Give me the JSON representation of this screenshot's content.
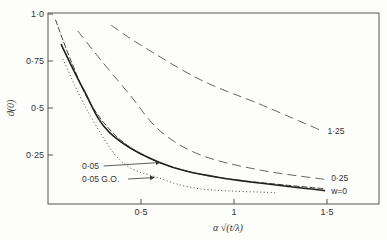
{
  "chart_data": {
    "type": "line",
    "title": "",
    "xlabel": "α √(t/λ)",
    "ylabel": "ϑ(0)",
    "xlim": [
      0,
      1.78
    ],
    "ylim": [
      0,
      1.0
    ],
    "x_ticks": [
      {
        "value": 0.5,
        "label": "0·5"
      },
      {
        "value": 1.0,
        "label": "1"
      },
      {
        "value": 1.5,
        "label": "1·5"
      }
    ],
    "y_ticks": [
      {
        "value": 0.25,
        "label": "0·25"
      },
      {
        "value": 0.5,
        "label": "0·5"
      },
      {
        "value": 0.75,
        "label": "0·75"
      },
      {
        "value": 1.0,
        "label": "1·0"
      }
    ],
    "grid": false,
    "series": [
      {
        "name": "1·25",
        "style": "long-dash",
        "points": [
          [
            0.34,
            0.94
          ],
          [
            0.49,
            0.84
          ],
          [
            0.82,
            0.65
          ],
          [
            1.14,
            0.52
          ],
          [
            1.47,
            0.38
          ]
        ]
      },
      {
        "name": "0·25",
        "style": "long-dash",
        "points": [
          [
            0.16,
            0.91
          ],
          [
            0.28,
            0.76
          ],
          [
            0.44,
            0.57
          ],
          [
            0.6,
            0.38
          ],
          [
            0.82,
            0.25
          ],
          [
            1.14,
            0.17
          ],
          [
            1.49,
            0.12
          ]
        ]
      },
      {
        "name": "0·05",
        "style": "dash",
        "points": [
          [
            0.04,
            0.97
          ],
          [
            0.12,
            0.76
          ],
          [
            0.23,
            0.52
          ],
          [
            0.39,
            0.33
          ],
          [
            0.6,
            0.21
          ],
          [
            0.92,
            0.13
          ],
          [
            1.49,
            0.07
          ]
        ]
      },
      {
        "name": "w=0",
        "style": "solid",
        "points": [
          [
            0.07,
            0.84
          ],
          [
            0.19,
            0.6
          ],
          [
            0.33,
            0.37
          ],
          [
            0.6,
            0.21
          ],
          [
            0.92,
            0.13
          ],
          [
            1.49,
            0.06
          ]
        ]
      },
      {
        "name": "0·05 G.O.",
        "style": "dotted",
        "points": [
          [
            0.08,
            0.76
          ],
          [
            0.21,
            0.49
          ],
          [
            0.39,
            0.22
          ],
          [
            0.59,
            0.13
          ],
          [
            0.82,
            0.07
          ],
          [
            1.22,
            0.05
          ]
        ]
      }
    ],
    "annotations": [
      {
        "text": "1·25",
        "series": "1·25",
        "placement": "end"
      },
      {
        "text": "0·25",
        "series": "0·25",
        "placement": "end"
      },
      {
        "text": "w=0",
        "series": "w=0",
        "placement": "end"
      },
      {
        "text": "0·05",
        "series": "0·05",
        "placement": "arrow",
        "arrow_to": [
          0.6,
          0.21
        ]
      },
      {
        "text": "0·05 G.O.",
        "series": "0·05 G.O.",
        "placement": "arrow",
        "arrow_to": [
          0.57,
          0.13
        ]
      }
    ]
  }
}
